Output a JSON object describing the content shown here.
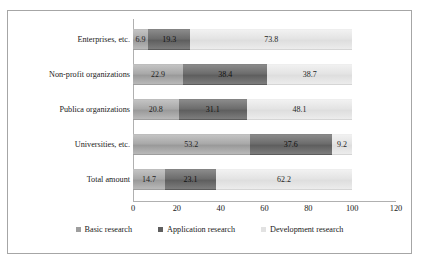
{
  "chart_data": {
    "type": "bar",
    "orientation": "horizontal",
    "stacked": true,
    "title": "",
    "xlabel": "",
    "ylabel": "",
    "xlim": [
      0,
      120
    ],
    "xticks": [
      "0",
      "20",
      "40",
      "60",
      "80",
      "100",
      "120"
    ],
    "grid": false,
    "legend_position": "bottom",
    "categories": [
      "Enterprises, etc.",
      "Non-profit organizations",
      "Publica organizations",
      "Universities, etc.",
      "Total amount"
    ],
    "series": [
      {
        "name": "Basic research",
        "color": "#9e9e9e",
        "values": [
          6.9,
          22.9,
          20.8,
          53.2,
          14.7
        ]
      },
      {
        "name": "Application research",
        "color": "#5f5f5f",
        "values": [
          19.3,
          38.4,
          31.1,
          37.6,
          23.1
        ]
      },
      {
        "name": "Development research",
        "color": "#e2e2e2",
        "values": [
          73.8,
          38.7,
          48.1,
          9.2,
          62.2
        ]
      }
    ]
  }
}
